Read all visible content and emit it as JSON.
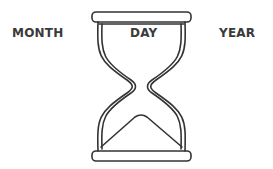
{
  "labels": {
    "left": "MONTH",
    "center": "DAY",
    "right": "YEAR"
  },
  "illustration": {
    "icon": "hourglass-icon",
    "stroke_color": "#333333"
  }
}
